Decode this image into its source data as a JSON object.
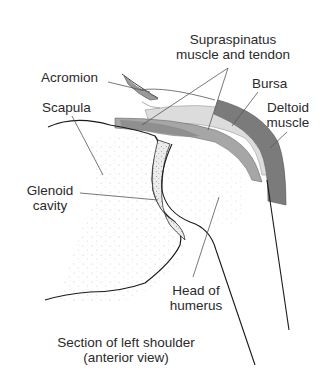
{
  "figure": {
    "title": "Section of left shoulder",
    "subtitle": "(anterior view)"
  },
  "labels": {
    "supraspinatus": {
      "line1": "Supraspinatus",
      "line2": "muscle and tendon"
    },
    "acromion": "Acromion",
    "scapula": "Scapula",
    "bursa": "Bursa",
    "deltoid": {
      "line1": "Deltoid",
      "line2": "muscle"
    },
    "glenoid": {
      "line1": "Glenoid",
      "line2": "cavity"
    },
    "humerus": {
      "line1": "Head of",
      "line2": "humerus"
    }
  },
  "colors": {
    "deltoid": "#7a7a7a",
    "supraspinatus": "#a8a8a8",
    "bursa": "#d9d9d9",
    "outline": "#1a1a1a",
    "leader": "#555555",
    "stipple": "#c8c8c8"
  }
}
